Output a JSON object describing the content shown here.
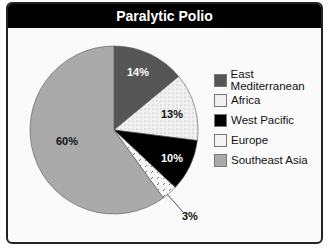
{
  "chart_data": {
    "type": "pie",
    "title": "Paralytic Polio",
    "categories": [
      "East Mediterranean",
      "Africa",
      "West Pacific",
      "Europe",
      "Southeast Asia"
    ],
    "values": [
      14,
      13,
      10,
      3,
      60
    ],
    "labels": [
      "14%",
      "13%",
      "10%",
      "3%",
      "60%"
    ],
    "colors": [
      "#555555",
      "#f0f0f0",
      "#000000",
      "#f4f4f4",
      "#aaaaaa"
    ],
    "legend_position": "right"
  },
  "title": "Paralytic Polio",
  "legend": [
    {
      "label": "East Mediterranean",
      "color": "#555555"
    },
    {
      "label": "Africa",
      "color": "#f0f0f0"
    },
    {
      "label": "West Pacific",
      "color": "#000000"
    },
    {
      "label": "Europe",
      "color": "#f4f4f4"
    },
    {
      "label": "Southeast Asia",
      "color": "#aaaaaa"
    }
  ]
}
